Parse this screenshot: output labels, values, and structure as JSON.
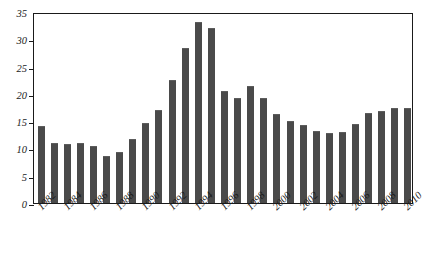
{
  "chart_data": {
    "type": "bar",
    "title": "",
    "xlabel": "",
    "ylabel": "",
    "ylim": [
      0,
      35
    ],
    "yticks": [
      0,
      5,
      10,
      15,
      20,
      25,
      30,
      35
    ],
    "grid": false,
    "legend": "none",
    "bar_color": "#4a4a4a",
    "axis_color": "#1a1a1a",
    "categories": [
      "1982",
      "1983",
      "1984",
      "1985",
      "1986",
      "1987",
      "1988",
      "1989",
      "1990",
      "1991",
      "1992",
      "1993",
      "1994",
      "1995",
      "1996",
      "1997",
      "1998",
      "1999",
      "2000",
      "2001",
      "2002",
      "2003",
      "2004",
      "2005",
      "2006",
      "2007",
      "2008",
      "2009",
      "2010"
    ],
    "tick_labels": [
      "1982",
      "1984",
      "1986",
      "1988",
      "1990",
      "1992",
      "1994",
      "1996",
      "1998",
      "2000",
      "2002",
      "2004",
      "2006",
      "2008",
      "2010"
    ],
    "values": [
      14.1,
      11.0,
      10.9,
      11.0,
      10.5,
      8.7,
      9.3,
      11.8,
      14.6,
      17.1,
      22.5,
      28.4,
      33.2,
      32.1,
      20.5,
      19.2,
      21.4,
      19.2,
      16.4,
      15.1,
      14.3,
      13.2,
      12.9,
      13.1,
      14.5,
      16.5,
      16.9,
      17.5,
      17.4
    ]
  }
}
